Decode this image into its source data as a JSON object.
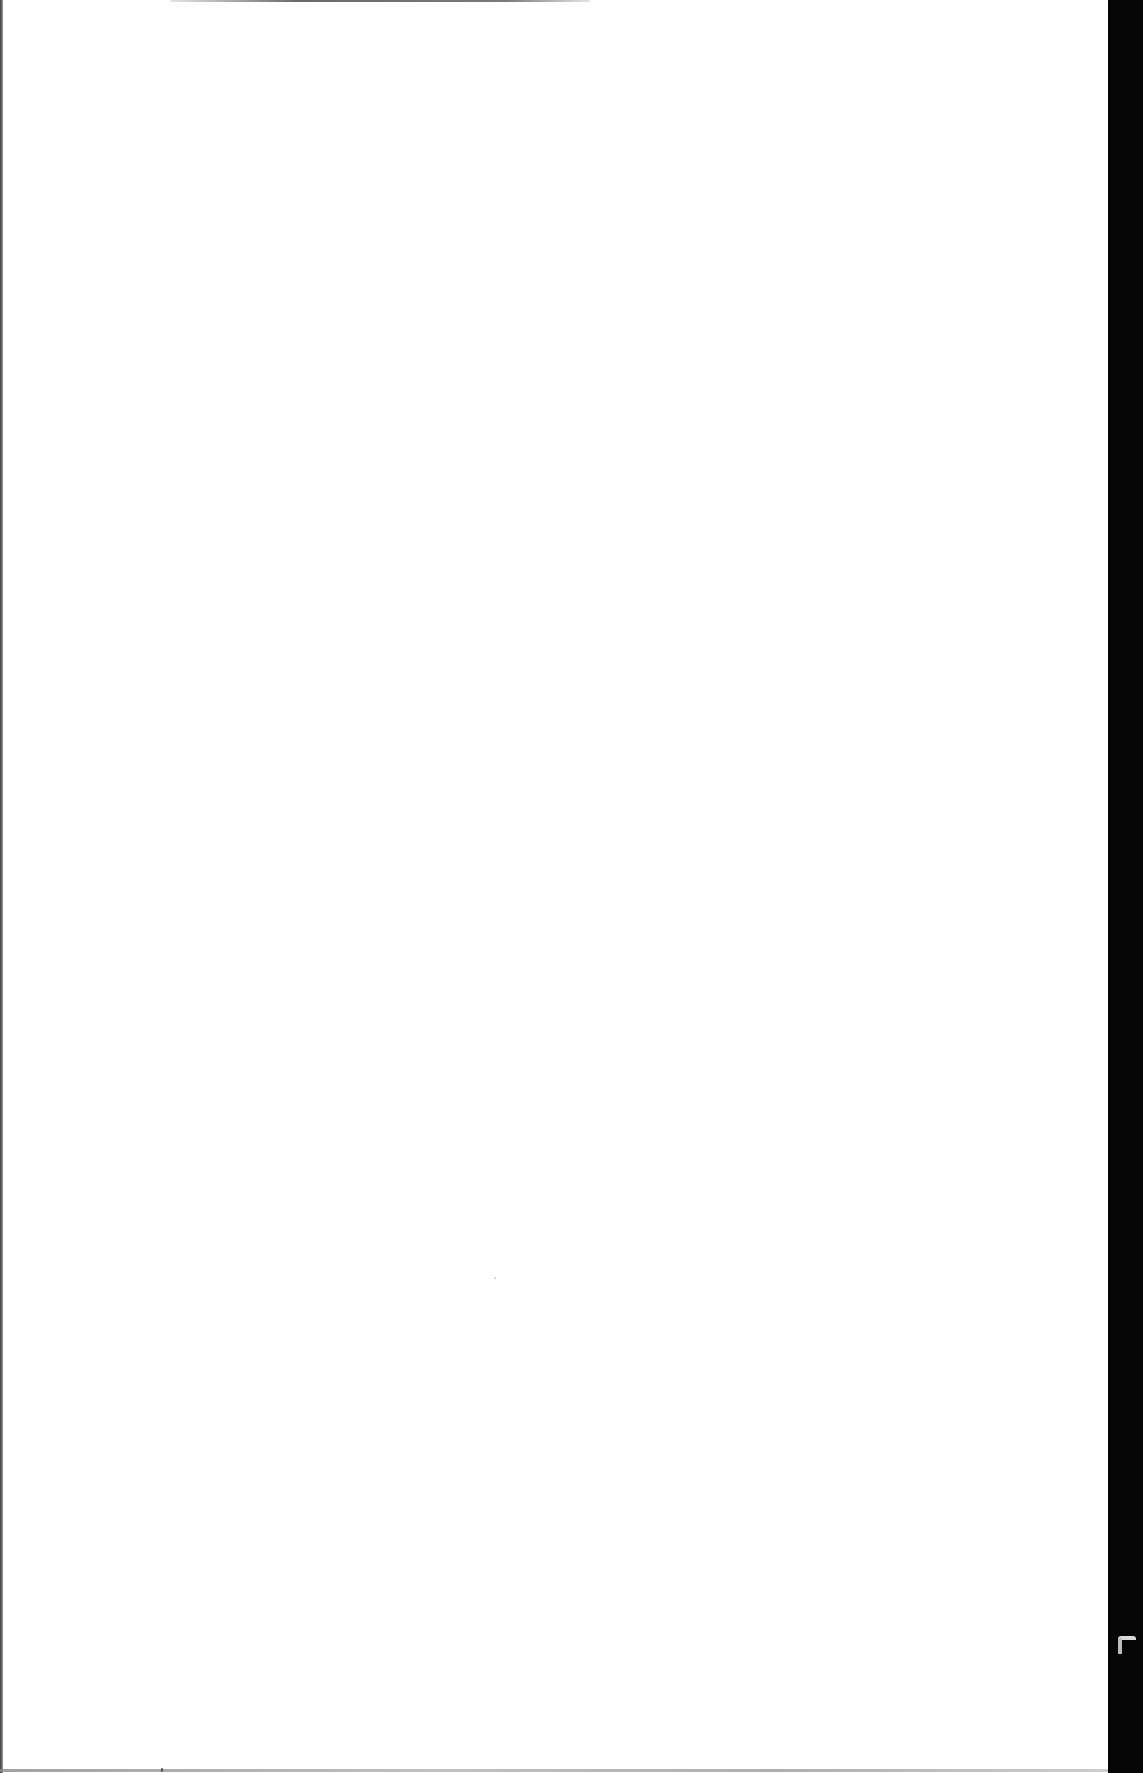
{
  "document": {
    "type": "scanned-page",
    "content": "",
    "is_blank": true
  },
  "appearance": {
    "page_color": "#ffffff",
    "right_border_color": "#050505",
    "left_border_color": "#3a3a3a"
  }
}
